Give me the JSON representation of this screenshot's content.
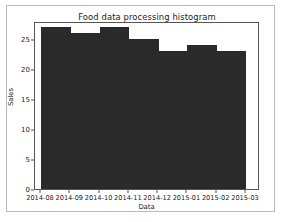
{
  "chart_data": {
    "type": "bar",
    "title": "Food data processing histogram",
    "xlabel": "Data",
    "ylabel": "Sales",
    "categories": [
      "2014-08",
      "2014-09",
      "2014-10",
      "2014-11",
      "2014-12",
      "2015-01",
      "2015-02"
    ],
    "values": [
      27,
      26,
      27,
      25,
      24,
      23,
      26
    ],
    "bins": [
      {
        "start": "2014-08",
        "end": "2014-09",
        "value": 27
      },
      {
        "start": "2014-09",
        "end": "2014-10",
        "value": 26
      },
      {
        "start": "2014-10",
        "end": "2014-11",
        "value": 27
      },
      {
        "start": "2014-11",
        "end": "2014-12",
        "value": 25
      },
      {
        "start": "2014-12",
        "end": "2015-01",
        "value": 23
      },
      {
        "start": "2015-01",
        "end": "2015-02",
        "value": 24
      },
      {
        "start": "2015-02",
        "end": "2015-03",
        "value": 23
      }
    ],
    "series": [
      {
        "name": "Sales",
        "values": [
          27,
          26,
          27,
          25,
          23,
          24,
          23
        ]
      }
    ],
    "xticklabels": [
      "2014-08",
      "2014-09",
      "2014-10",
      "2014-11",
      "2014-12",
      "2015-01",
      "2015-02",
      "2015-03"
    ],
    "yticklabels": [
      "0",
      "5",
      "10",
      "15",
      "20",
      "25"
    ],
    "ytickvalues": [
      0,
      5,
      10,
      15,
      20,
      25
    ],
    "ylim": [
      0,
      28
    ],
    "grid": false,
    "legend": null,
    "bar_color": "#2a2a2a",
    "axis_color": "#555555",
    "figure_background": "#ffffff"
  }
}
